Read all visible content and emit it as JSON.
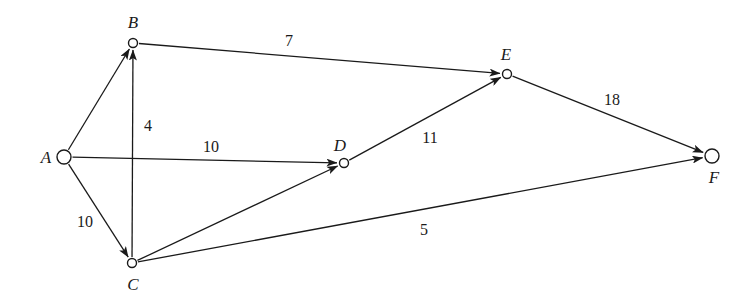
{
  "figure": {
    "type": "directed-weighted-graph",
    "background_color": "#ffffff",
    "stroke_color": "#1a1a1a",
    "width": 755,
    "height": 303
  },
  "nodes": [
    {
      "id": "A",
      "label": "A",
      "x": 64,
      "y": 157,
      "r": 7,
      "label_x": 46,
      "label_y": 157
    },
    {
      "id": "B",
      "label": "B",
      "x": 133,
      "y": 43,
      "r": 4.5,
      "label_x": 133,
      "label_y": 22
    },
    {
      "id": "C",
      "label": "C",
      "x": 132,
      "y": 263,
      "r": 4.5,
      "label_x": 133,
      "label_y": 284
    },
    {
      "id": "D",
      "label": "D",
      "x": 344,
      "y": 163,
      "r": 4.5,
      "label_x": 340,
      "label_y": 145
    },
    {
      "id": "E",
      "label": "E",
      "x": 507,
      "y": 74,
      "r": 4.5,
      "label_x": 506,
      "label_y": 54
    },
    {
      "id": "F",
      "label": "F",
      "x": 712,
      "y": 156,
      "r": 7,
      "label_x": 714,
      "label_y": 177
    }
  ],
  "edges": [
    {
      "id": "A-B",
      "from": "A",
      "to": "B",
      "weight": "",
      "label_x": 0,
      "label_y": 0,
      "directed": true
    },
    {
      "id": "C-B",
      "from": "C",
      "to": "B",
      "weight": "4",
      "label_x": 148,
      "label_y": 126,
      "directed": true
    },
    {
      "id": "A-C",
      "from": "A",
      "to": "C",
      "weight": "10",
      "label_x": 85,
      "label_y": 222,
      "directed": true
    },
    {
      "id": "A-D",
      "from": "A",
      "to": "D",
      "weight": "10",
      "label_x": 211,
      "label_y": 147,
      "directed": true
    },
    {
      "id": "C-D",
      "from": "C",
      "to": "D",
      "weight": "",
      "label_x": 0,
      "label_y": 0,
      "directed": true
    },
    {
      "id": "B-E",
      "from": "B",
      "to": "E",
      "weight": "7",
      "label_x": 289,
      "label_y": 41,
      "directed": true
    },
    {
      "id": "D-E",
      "from": "D",
      "to": "E",
      "weight": "11",
      "label_x": 430,
      "label_y": 138,
      "directed": true
    },
    {
      "id": "E-F",
      "from": "E",
      "to": "F",
      "weight": "18",
      "label_x": 612,
      "label_y": 100,
      "directed": true
    },
    {
      "id": "C-F",
      "from": "C",
      "to": "F",
      "weight": "5",
      "label_x": 424,
      "label_y": 230,
      "directed": true
    }
  ]
}
